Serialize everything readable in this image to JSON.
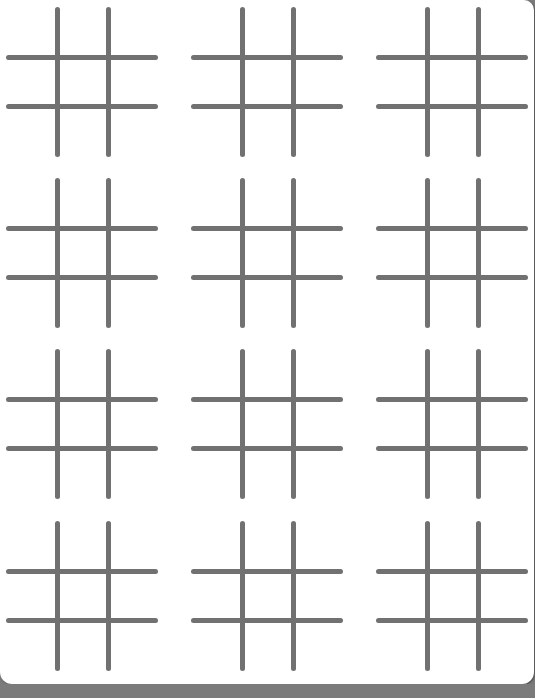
{
  "app": {
    "type": "tic-tac-toe boards",
    "board_count": 12,
    "columns": 3,
    "rows": 4
  },
  "colors": {
    "background": "#ffffff",
    "grid_line": "#717171",
    "bottom_band": "#7b7b7b"
  },
  "layout": {
    "column_lefts": [
      6,
      191,
      376
    ],
    "row_tops": [
      7,
      178,
      349,
      521
    ]
  },
  "boards": [
    {
      "id": 1,
      "cells": [
        "",
        "",
        "",
        "",
        "",
        "",
        "",
        "",
        ""
      ]
    },
    {
      "id": 2,
      "cells": [
        "",
        "",
        "",
        "",
        "",
        "",
        "",
        "",
        ""
      ]
    },
    {
      "id": 3,
      "cells": [
        "",
        "",
        "",
        "",
        "",
        "",
        "",
        "",
        ""
      ]
    },
    {
      "id": 4,
      "cells": [
        "",
        "",
        "",
        "",
        "",
        "",
        "",
        "",
        ""
      ]
    },
    {
      "id": 5,
      "cells": [
        "",
        "",
        "",
        "",
        "",
        "",
        "",
        "",
        ""
      ]
    },
    {
      "id": 6,
      "cells": [
        "",
        "",
        "",
        "",
        "",
        "",
        "",
        "",
        ""
      ]
    },
    {
      "id": 7,
      "cells": [
        "",
        "",
        "",
        "",
        "",
        "",
        "",
        "",
        ""
      ]
    },
    {
      "id": 8,
      "cells": [
        "",
        "",
        "",
        "",
        "",
        "",
        "",
        "",
        ""
      ]
    },
    {
      "id": 9,
      "cells": [
        "",
        "",
        "",
        "",
        "",
        "",
        "",
        "",
        ""
      ]
    },
    {
      "id": 10,
      "cells": [
        "",
        "",
        "",
        "",
        "",
        "",
        "",
        "",
        ""
      ]
    },
    {
      "id": 11,
      "cells": [
        "",
        "",
        "",
        "",
        "",
        "",
        "",
        "",
        ""
      ]
    },
    {
      "id": 12,
      "cells": [
        "",
        "",
        "",
        "",
        "",
        "",
        "",
        "",
        ""
      ]
    }
  ]
}
